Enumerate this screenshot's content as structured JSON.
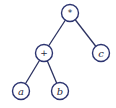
{
  "diagram": {
    "type": "expression-tree",
    "expression": "(a + b) * c",
    "colors": {
      "node_stroke": "#2c3470",
      "edge": "#2b3160",
      "label": "#2a2a40",
      "background": "#ffffff"
    },
    "nodes": [
      {
        "id": "root",
        "label": "*",
        "kind": "operator",
        "cx": 70,
        "cy": 13
      },
      {
        "id": "plus",
        "label": "+",
        "kind": "operator",
        "cx": 44,
        "cy": 53
      },
      {
        "id": "c",
        "label": "c",
        "kind": "operand",
        "cx": 101,
        "cy": 53
      },
      {
        "id": "a",
        "label": "a",
        "kind": "operand",
        "cx": 21,
        "cy": 91
      },
      {
        "id": "b",
        "label": "b",
        "kind": "operand",
        "cx": 60,
        "cy": 91
      }
    ],
    "edges": [
      {
        "from": "root",
        "to": "plus"
      },
      {
        "from": "root",
        "to": "c"
      },
      {
        "from": "plus",
        "to": "a"
      },
      {
        "from": "plus",
        "to": "b"
      }
    ]
  }
}
